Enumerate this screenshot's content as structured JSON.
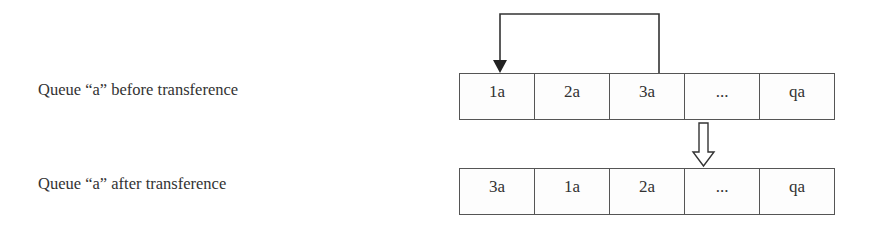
{
  "diagram": {
    "labels": {
      "before": "Queue “a” before transference",
      "after": "Queue “a” after transference"
    },
    "queue_before": {
      "cells": [
        "1a",
        "2a",
        "3a",
        "...",
        "qa"
      ]
    },
    "queue_after": {
      "cells": [
        "3a",
        "1a",
        "2a",
        "...",
        "qa"
      ]
    },
    "arrows": {
      "transfer": "move-3a-to-front-arrow",
      "transition": "hollow-down-arrow"
    },
    "colors": {
      "line": "#333333",
      "text": "#333333",
      "border": "#555555"
    }
  }
}
